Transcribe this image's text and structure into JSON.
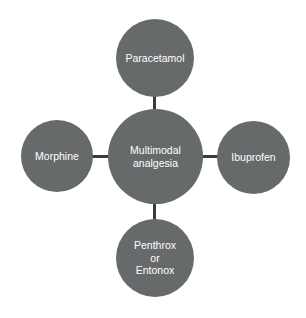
{
  "diagram": {
    "type": "hub-and-spoke",
    "title": "Multimodal analgesia",
    "background_color": "#ffffff",
    "node_color": "#676a6b",
    "node_text_color": "#ffffff",
    "connector_color": "#3c3c3c",
    "hub": {
      "id": "multimodal-analgesia",
      "lines": [
        "Multimodal",
        "analgesia"
      ]
    },
    "nodes": [
      {
        "id": "paracetamol",
        "position": "top",
        "lines": [
          "Paracetamol"
        ]
      },
      {
        "id": "ibuprofen",
        "position": "right",
        "lines": [
          "Ibuprofen"
        ]
      },
      {
        "id": "penthrox-or-entonox",
        "position": "bottom",
        "lines": [
          "Penthrox",
          "or",
          "Entonox"
        ]
      },
      {
        "id": "morphine",
        "position": "left",
        "lines": [
          "Morphine"
        ]
      }
    ],
    "connectors": [
      {
        "id": "hub-to-paracetamol",
        "from": "multimodal-analgesia",
        "to": "paracetamol",
        "orientation": "vertical"
      },
      {
        "id": "hub-to-ibuprofen",
        "from": "multimodal-analgesia",
        "to": "ibuprofen",
        "orientation": "horizontal"
      },
      {
        "id": "hub-to-penthrox",
        "from": "multimodal-analgesia",
        "to": "penthrox-or-entonox",
        "orientation": "vertical"
      },
      {
        "id": "hub-to-morphine",
        "from": "multimodal-analgesia",
        "to": "morphine",
        "orientation": "horizontal"
      }
    ]
  }
}
